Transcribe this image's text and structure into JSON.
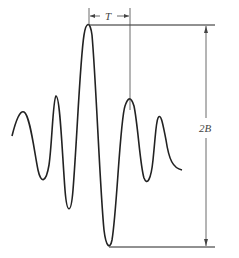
{
  "diagram": {
    "title": "",
    "labels": {
      "period": "T",
      "amplitude": "2B"
    },
    "colors": {
      "line": "#222222",
      "annotation": "#444444",
      "background": "#ffffff"
    },
    "waveform": {
      "description": "Damped oscillating pulse with central maximum, symmetric decaying side lobes",
      "peak_top_y": 25,
      "trough_bottom_y": 247
    }
  }
}
